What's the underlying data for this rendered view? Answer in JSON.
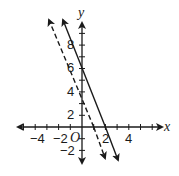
{
  "graph": {
    "x_axis_label": "x",
    "y_axis_label": "y",
    "origin_label": "O",
    "x_ticks": {
      "range": [
        -5,
        6
      ],
      "step": 1
    },
    "y_ticks": {
      "range": [
        -3,
        9
      ],
      "step": 1
    },
    "x_tick_labels": [
      "−4",
      "−2",
      "2",
      "4"
    ],
    "y_tick_labels": [
      "8",
      "6",
      "4",
      "2",
      "−2"
    ],
    "lines": [
      {
        "name": "solid",
        "style": "solid",
        "equation": "y = -3x + 6",
        "y_intercept": 6,
        "x_intercept": 2
      },
      {
        "name": "dashed",
        "style": "dashed",
        "equation": "y = -3x + 3",
        "y_intercept": 3,
        "x_intercept": 1
      }
    ]
  }
}
